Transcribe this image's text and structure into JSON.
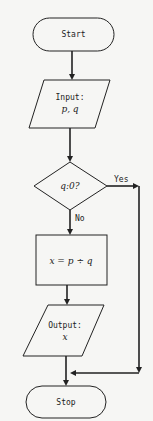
{
  "flowchart": {
    "start": {
      "label": "Start"
    },
    "input": {
      "line1": "Input:",
      "line2": "p, q"
    },
    "decision": {
      "label": "q:0?",
      "yes_label": "Yes",
      "no_label": "No"
    },
    "process": {
      "label": "x = p ÷ q"
    },
    "output": {
      "line1": "Output:",
      "line2": "x"
    },
    "stop": {
      "label": "Stop"
    }
  },
  "colors": {
    "background": "#f6f6f4",
    "stroke": "#222222"
  }
}
